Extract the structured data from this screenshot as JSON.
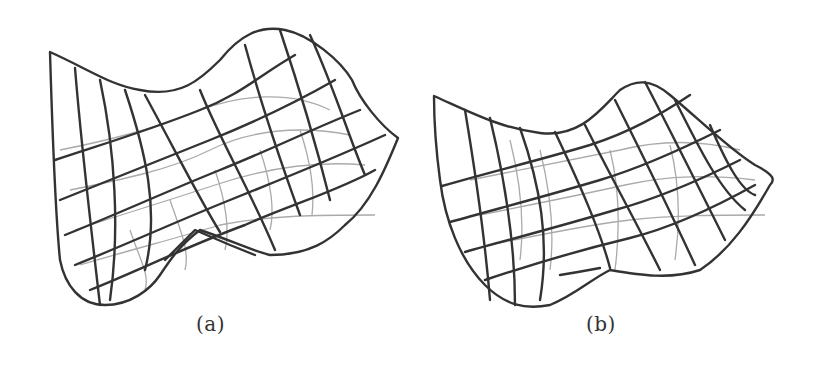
{
  "figures": [
    {
      "id": "a",
      "caption": "(a)",
      "description": "3D wireframe saddle-like surface with deep trough at the front"
    },
    {
      "id": "b",
      "caption": "(b)",
      "description": "3D wireframe surface with smoother valley"
    }
  ],
  "colors": {
    "mesh_dark": "#333333",
    "mesh_light": "#aaaaaa",
    "background": "#ffffff"
  }
}
